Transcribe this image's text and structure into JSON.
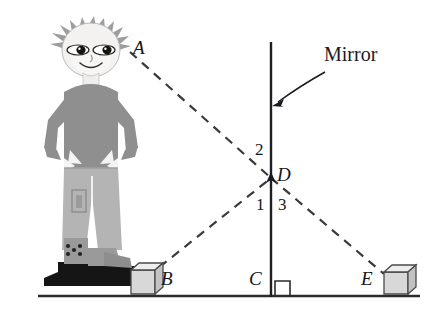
{
  "figure": {
    "mirror_label": "Mirror",
    "points": {
      "A": "A",
      "B": "B",
      "C": "C",
      "D": "D",
      "E": "E"
    },
    "angles": {
      "one": "1",
      "two": "2",
      "three": "3"
    },
    "colors": {
      "ink": "#16161a",
      "ground": "#2b2b2f",
      "mirror": "#1f1f23",
      "ray": "#3a3a3e",
      "skin": "#f2f0ee",
      "hair": "#9d9d9d",
      "shirt": "#8f8f8f",
      "pants": "#b4b4b4",
      "boot_dark": "#161616",
      "boot_gray": "#9a9a9a",
      "box_face": "#d8d8d8",
      "box_top": "#ededed",
      "box_side": "#c2c2c2",
      "box_edge": "#4a4a4a"
    },
    "geometry": {
      "ground_y": 296,
      "ground_x1": 38,
      "ground_x2": 420,
      "mirror_x": 271,
      "mirror_y_top": 42,
      "mirror_y_bottom": 296,
      "point_A": [
        130,
        52
      ],
      "point_B": [
        148,
        277
      ],
      "point_C": [
        271,
        296
      ],
      "point_D": [
        271,
        178
      ],
      "point_E": [
        383,
        275
      ]
    }
  }
}
